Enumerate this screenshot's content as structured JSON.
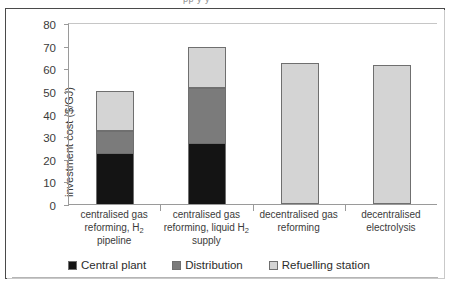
{
  "top_clipped_text": "pp y y",
  "chart_data": {
    "type": "bar",
    "stacked": true,
    "title": "",
    "xlabel": "",
    "ylabel": "investment cost ($/GJ)",
    "ylim": [
      0,
      80
    ],
    "yticks": [
      0,
      10,
      20,
      30,
      40,
      50,
      60,
      70,
      80
    ],
    "grid": false,
    "legend_position": "bottom",
    "categories": [
      "centralised gas reforming, H₂ pipeline",
      "centralised gas reforming, liquid H₂ supply",
      "decentralised gas reforming",
      "decentralised electrolysis"
    ],
    "category_lines": [
      [
        "centralised gas",
        "reforming, H",
        "pipeline"
      ],
      [
        "centralised gas",
        "reforming, liquid H",
        "supply"
      ],
      [
        "decentralised gas",
        "reforming"
      ],
      [
        "decentralised",
        "electrolysis"
      ]
    ],
    "series": [
      {
        "name": "Central plant",
        "color": "#141414",
        "values": [
          23,
          27.5,
          0,
          0
        ]
      },
      {
        "name": "Distribution",
        "color": "#7b7b7b",
        "values": [
          10,
          24.5,
          0,
          0
        ]
      },
      {
        "name": "Refuelling station",
        "color": "#d4d4d4",
        "values": [
          18,
          18.5,
          62.5,
          61.5
        ]
      }
    ],
    "totals": [
      51,
      70.5,
      62.5,
      61.5
    ]
  },
  "legend": {
    "items": [
      {
        "label": "Central plant",
        "color": "#141414"
      },
      {
        "label": "Distribution",
        "color": "#7b7b7b"
      },
      {
        "label": "Refuelling station",
        "color": "#d4d4d4"
      }
    ]
  }
}
